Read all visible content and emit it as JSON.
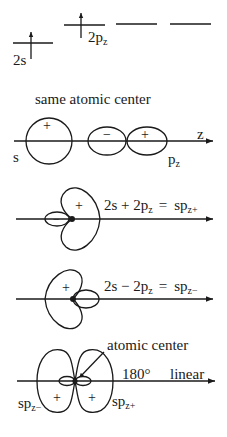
{
  "energy_levels": {
    "s_label": "2s",
    "p_label": "2p",
    "p_sub": "z"
  },
  "panel1": {
    "title": "same atomic center",
    "axis_label": "z",
    "s_label": "s",
    "p_label": "p",
    "p_sub": "z",
    "s_sign": "+",
    "p_neg_sign": "−",
    "p_pos_sign": "+"
  },
  "panel2": {
    "eq_lhs": "2s + 2p",
    "eq_lhs_sub": "z",
    "eq_eq": "=",
    "eq_rhs": "sp",
    "eq_rhs_sub": "z+",
    "big_sign": "+",
    "small_sign": "−"
  },
  "panel3": {
    "eq_lhs": "2s − 2p",
    "eq_lhs_sub": "z",
    "eq_eq": "=",
    "eq_rhs": "sp",
    "eq_rhs_sub": "z−",
    "big_sign": "+"
  },
  "panel4": {
    "callout": "atomic center",
    "angle": "180°",
    "geometry": "linear",
    "left_label": "sp",
    "left_sub": "z−",
    "right_label": "sp",
    "right_sub": "z+",
    "left_sign": "+",
    "right_sign": "+"
  },
  "colors": {
    "ink": "#1a1a1a",
    "background": "#ffffff"
  }
}
